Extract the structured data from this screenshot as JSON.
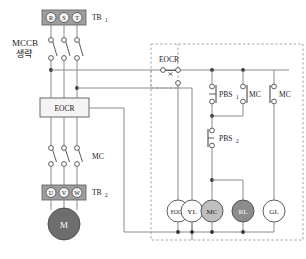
{
  "diagram": {
    "power_block": {
      "terminal_block_top": {
        "name": "TB1",
        "label": "TB",
        "sub": "1",
        "terminals": [
          "R",
          "S",
          "T"
        ]
      },
      "breaker": {
        "label_line1": "MCCB",
        "label_line2": "생략"
      },
      "eocr_box": {
        "label": "EOCR"
      },
      "mc_contactor": {
        "label": "MC"
      },
      "terminal_block_bottom": {
        "name": "TB2",
        "label": "TB",
        "sub": "2",
        "terminals": [
          "U",
          "V",
          "W"
        ]
      },
      "motor": {
        "label": "M"
      }
    },
    "control_block": {
      "eocr_contact": {
        "label": "EOCR"
      },
      "pbs1": {
        "label": "PBS",
        "sub": "1",
        "type": "normally-closed"
      },
      "pbs2": {
        "label": "PBS",
        "sub": "2",
        "type": "normally-open"
      },
      "mc_aux_1": {
        "label": "MC",
        "type": "normally-open"
      },
      "mc_aux_2": {
        "label": "MC",
        "type": "normally-open"
      },
      "lamps": [
        {
          "label": "EOCR",
          "fill": "#ffffff",
          "text_fill": "#1a1a1a"
        },
        {
          "label": "YL",
          "fill": "#fbfbfb",
          "text_fill": "#1a1a1a"
        },
        {
          "label": "MC",
          "fill": "#bfbfbf",
          "text_fill": "#1a1a1a"
        },
        {
          "label": "RL",
          "fill": "#8c8c8c",
          "text_fill": "#ffffff"
        },
        {
          "label": "GL",
          "fill": "#ffffff",
          "text_fill": "#1a1a1a"
        }
      ]
    },
    "colors": {
      "wire": "#8a8a8a",
      "node": "#333333",
      "outline": "#555555",
      "dashed_border": "#9a9a9a",
      "terminal_fill": "#9e9e9e",
      "motor_fill": "#6e6e6e"
    }
  }
}
